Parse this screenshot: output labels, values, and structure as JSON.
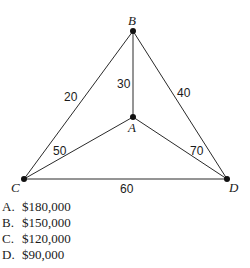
{
  "diagram": {
    "nodes": [
      {
        "id": "A",
        "label": "A",
        "x": 133,
        "y": 117
      },
      {
        "id": "B",
        "label": "B",
        "x": 133,
        "y": 31
      },
      {
        "id": "C",
        "label": "C",
        "x": 24,
        "y": 179
      },
      {
        "id": "D",
        "label": "D",
        "x": 227,
        "y": 179
      }
    ],
    "edges": [
      {
        "from": "C",
        "to": "B",
        "weight": "20"
      },
      {
        "from": "A",
        "to": "B",
        "weight": "30"
      },
      {
        "from": "B",
        "to": "D",
        "weight": "40"
      },
      {
        "from": "C",
        "to": "A",
        "weight": "50"
      },
      {
        "from": "C",
        "to": "D",
        "weight": "60"
      },
      {
        "from": "A",
        "to": "D",
        "weight": "70"
      }
    ]
  },
  "choices": [
    {
      "letter": "A.",
      "text": "$180,000"
    },
    {
      "letter": "B.",
      "text": "$150,000"
    },
    {
      "letter": "C.",
      "text": "$120,000"
    },
    {
      "letter": "D.",
      "text": "$90,000"
    }
  ]
}
